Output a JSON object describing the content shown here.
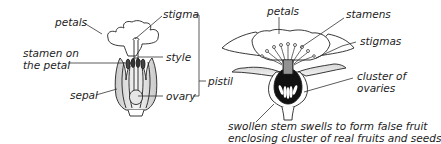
{
  "flower_left": {
    "labels": {
      "petals": "petals",
      "stigma": "stigma",
      "stamen_line1": "stamen on",
      "stamen_line2": "the petal",
      "style": "style",
      "sepal": "sepal",
      "ovary": "ovary",
      "pistil": "pistil"
    }
  },
  "flower_right": {
    "labels": {
      "petals": "petals",
      "stamens": "stamens",
      "stigmas": "stigmas",
      "cluster_line1": "cluster of",
      "cluster_line2": "ovaries",
      "caption_line1": "swollen stem swells to form false fruit",
      "caption_line2": "enclosing cluster of real fruits and seeds"
    }
  },
  "colors": {
    "ink": "#222222",
    "shade": "#cfcfcf",
    "ovary_fill": "#111111"
  }
}
